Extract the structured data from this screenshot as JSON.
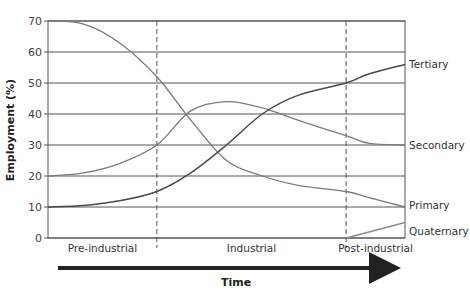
{
  "chart_data": {
    "type": "line",
    "title": "",
    "xlabel": "Time",
    "ylabel": "Employment (%)",
    "ylim": [
      0,
      70
    ],
    "yticks": [
      0,
      10,
      20,
      30,
      40,
      50,
      60,
      70
    ],
    "grid": true,
    "phases": [
      "Pre-industrial",
      "Industrial",
      "Post-industrial"
    ],
    "phase_boundaries": [
      0.305,
      0.835
    ],
    "x": [
      0,
      0.1,
      0.2,
      0.305,
      0.4,
      0.5,
      0.6,
      0.7,
      0.835,
      0.9,
      1.0
    ],
    "series": [
      {
        "name": "Primary",
        "values": [
          70,
          69,
          63,
          52,
          38,
          25,
          20,
          17,
          15,
          13,
          10
        ],
        "color": "#7a7a7a"
      },
      {
        "name": "Secondary",
        "values": [
          20,
          21,
          24,
          30,
          41,
          44,
          42,
          38,
          33,
          30.5,
          30
        ],
        "color": "#7a7a7a"
      },
      {
        "name": "Tertiary",
        "values": [
          10,
          10.5,
          12,
          15,
          21,
          30,
          40,
          46,
          50,
          53,
          56
        ],
        "color": "#4a4a4a"
      },
      {
        "name": "Quaternary",
        "values": [
          null,
          null,
          null,
          null,
          null,
          null,
          null,
          null,
          0,
          2,
          5
        ],
        "color": "#8a8a8a"
      }
    ],
    "legend_position": "right-end-labels"
  },
  "labels": {
    "ylabel": "Employment (%)",
    "xlabel": "Time",
    "phases": [
      "Pre-industrial",
      "Industrial",
      "Post-industrial"
    ],
    "series": [
      "Tertiary",
      "Secondary",
      "Primary",
      "Quaternary"
    ]
  }
}
